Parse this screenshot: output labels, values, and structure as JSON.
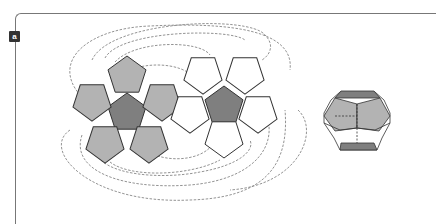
{
  "figure": {
    "panel_label": "a",
    "net_left": {
      "center_face": "dark",
      "outer_faces": "gray",
      "count": 6
    },
    "net_right": {
      "center_face": "dark",
      "outer_faces": "white",
      "count": 6
    },
    "solid": {
      "name": "dodecahedron",
      "top_face": "dark",
      "bottom_face": "dark"
    }
  },
  "colors": {
    "dark": "#7f7f7f",
    "gray": "#b3b3b3",
    "white": "#ffffff",
    "stroke": "#333333",
    "dash": "#777777"
  }
}
